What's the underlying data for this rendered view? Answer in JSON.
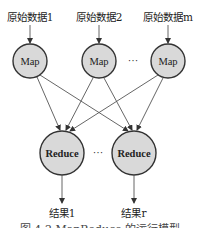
{
  "diagram": {
    "inputs": [
      {
        "label": "原始数据1"
      },
      {
        "label": "原始数据2"
      },
      {
        "label": "原始数据m"
      }
    ],
    "map_nodes": [
      {
        "label": "Map"
      },
      {
        "label": "Map"
      },
      {
        "label": "Map"
      }
    ],
    "map_ellipsis": "···",
    "reduce_nodes": [
      {
        "label": "Reduce"
      },
      {
        "label": "Reduce"
      }
    ],
    "reduce_ellipsis": "···",
    "outputs": [
      {
        "label": "结果1"
      },
      {
        "label": "结果r"
      }
    ],
    "caption": "图 4-2  MapReduce 的运行模型",
    "colors": {
      "node_fill": "#d9d9d9",
      "node_stroke": "#333333",
      "edge": "#555555"
    }
  }
}
